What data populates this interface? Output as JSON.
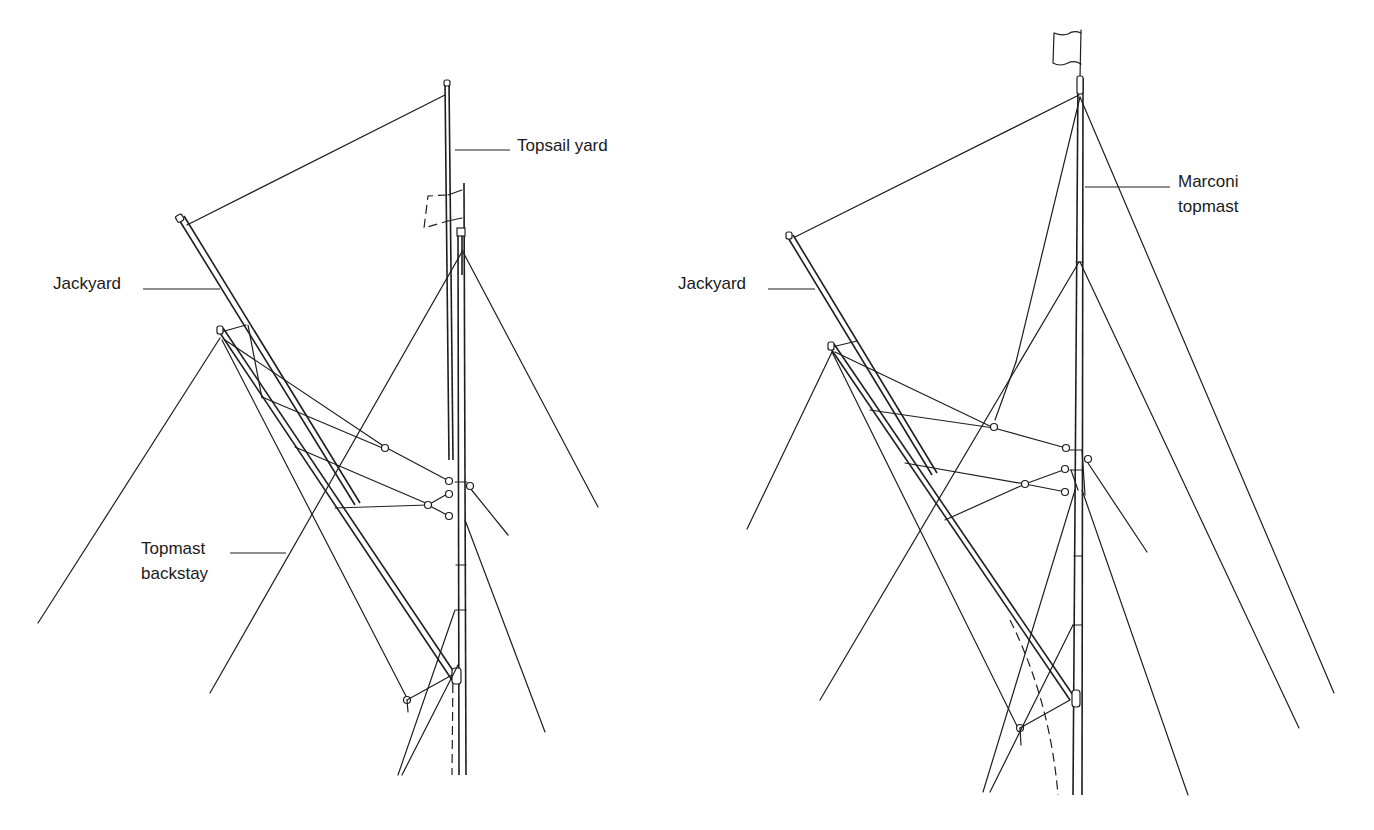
{
  "diagrams": [
    {
      "id": "left",
      "title": "Topsail rig with jackyard and topmast",
      "labels": {
        "topsail_yard": "Topsail yard",
        "jackyard": "Jackyard",
        "topmast_backstay_line1": "Topmast",
        "topmast_backstay_line2": "backstay"
      }
    },
    {
      "id": "right",
      "title": "Topsail rig with jackyard and Marconi topmast",
      "labels": {
        "marconi_line1": "Marconi",
        "marconi_line2": "topmast",
        "jackyard": "Jackyard"
      }
    }
  ],
  "style": {
    "ink": "#1e1e1e",
    "background": "#ffffff"
  }
}
